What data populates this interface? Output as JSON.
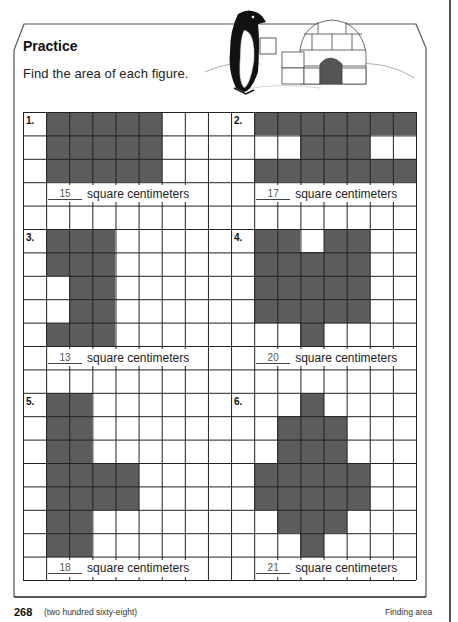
{
  "header": {
    "title": "Practice",
    "instruction": "Find the area of each figure."
  },
  "illustration": {
    "description": "penguin holding a square card beside an igloo",
    "icons": [
      "penguin-icon",
      "igloo-icon"
    ]
  },
  "grid": {
    "columns": 17,
    "rows": 20,
    "line_color": "#222222",
    "shade_color": "#5c5c5c"
  },
  "unit_label": "square centimeters",
  "problems": [
    {
      "number": "1.",
      "answer": "15",
      "unit": "square centimeters",
      "label_cell": [
        0,
        0
      ],
      "answer_row": 3,
      "answer_col": 1,
      "shaded": [
        [
          1,
          0
        ],
        [
          2,
          0
        ],
        [
          3,
          0
        ],
        [
          4,
          0
        ],
        [
          5,
          0
        ],
        [
          1,
          1
        ],
        [
          2,
          1
        ],
        [
          3,
          1
        ],
        [
          4,
          1
        ],
        [
          5,
          1
        ],
        [
          1,
          2
        ],
        [
          2,
          2
        ],
        [
          3,
          2
        ],
        [
          4,
          2
        ],
        [
          5,
          2
        ]
      ]
    },
    {
      "number": "2.",
      "answer": "17",
      "unit": "square centimeters",
      "label_cell": [
        9,
        0
      ],
      "answer_row": 3,
      "answer_col": 10,
      "shaded": [
        [
          10,
          0
        ],
        [
          11,
          0
        ],
        [
          12,
          0
        ],
        [
          13,
          0
        ],
        [
          14,
          0
        ],
        [
          15,
          0
        ],
        [
          16,
          0
        ],
        [
          12,
          1
        ],
        [
          13,
          1
        ],
        [
          14,
          1
        ],
        [
          10,
          2
        ],
        [
          11,
          2
        ],
        [
          12,
          2
        ],
        [
          13,
          2
        ],
        [
          14,
          2
        ],
        [
          15,
          2
        ],
        [
          16,
          2
        ]
      ]
    },
    {
      "number": "3.",
      "answer": "13",
      "unit": "square centimeters",
      "label_cell": [
        0,
        5
      ],
      "answer_row": 10,
      "answer_col": 1,
      "shaded": [
        [
          1,
          5
        ],
        [
          2,
          5
        ],
        [
          3,
          5
        ],
        [
          1,
          6
        ],
        [
          2,
          6
        ],
        [
          3,
          6
        ],
        [
          2,
          7
        ],
        [
          3,
          7
        ],
        [
          2,
          8
        ],
        [
          3,
          8
        ],
        [
          1,
          9
        ],
        [
          2,
          9
        ],
        [
          3,
          9
        ]
      ]
    },
    {
      "number": "4.",
      "answer": "20",
      "unit": "square centimeters",
      "label_cell": [
        9,
        5
      ],
      "answer_row": 10,
      "answer_col": 10,
      "shaded": [
        [
          10,
          5
        ],
        [
          11,
          5
        ],
        [
          13,
          5
        ],
        [
          14,
          5
        ],
        [
          10,
          6
        ],
        [
          11,
          6
        ],
        [
          12,
          6
        ],
        [
          13,
          6
        ],
        [
          14,
          6
        ],
        [
          10,
          7
        ],
        [
          11,
          7
        ],
        [
          12,
          7
        ],
        [
          13,
          7
        ],
        [
          14,
          7
        ],
        [
          10,
          8
        ],
        [
          11,
          8
        ],
        [
          12,
          8
        ],
        [
          13,
          8
        ],
        [
          14,
          8
        ],
        [
          12,
          9
        ]
      ]
    },
    {
      "number": "5.",
      "answer": "18",
      "unit": "square centimeters",
      "label_cell": [
        0,
        12
      ],
      "answer_row": 19,
      "answer_col": 1,
      "shaded": [
        [
          1,
          12
        ],
        [
          2,
          12
        ],
        [
          1,
          13
        ],
        [
          2,
          13
        ],
        [
          1,
          14
        ],
        [
          2,
          14
        ],
        [
          1,
          15
        ],
        [
          2,
          15
        ],
        [
          3,
          15
        ],
        [
          4,
          15
        ],
        [
          1,
          16
        ],
        [
          2,
          16
        ],
        [
          3,
          16
        ],
        [
          4,
          16
        ],
        [
          1,
          17
        ],
        [
          2,
          17
        ],
        [
          1,
          18
        ],
        [
          2,
          18
        ]
      ]
    },
    {
      "number": "6.",
      "answer": "21",
      "unit": "square centimeters",
      "label_cell": [
        9,
        12
      ],
      "answer_row": 19,
      "answer_col": 10,
      "shaded": [
        [
          12,
          12
        ],
        [
          11,
          13
        ],
        [
          12,
          13
        ],
        [
          13,
          13
        ],
        [
          11,
          14
        ],
        [
          12,
          14
        ],
        [
          13,
          14
        ],
        [
          10,
          15
        ],
        [
          11,
          15
        ],
        [
          12,
          15
        ],
        [
          13,
          15
        ],
        [
          14,
          15
        ],
        [
          10,
          16
        ],
        [
          11,
          16
        ],
        [
          12,
          16
        ],
        [
          13,
          16
        ],
        [
          14,
          16
        ],
        [
          11,
          17
        ],
        [
          12,
          17
        ],
        [
          13,
          17
        ],
        [
          12,
          18
        ]
      ]
    }
  ],
  "footer": {
    "page_number": "268",
    "page_words": "(two hundred sixty-eight)",
    "section": "Finding area"
  }
}
